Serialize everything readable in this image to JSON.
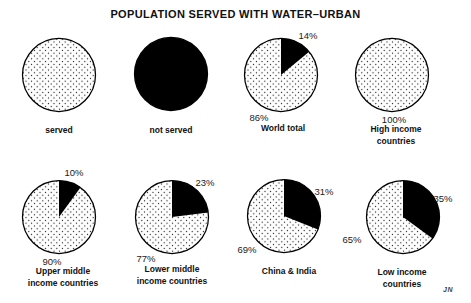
{
  "chart_data": {
    "type": "pie",
    "title": "POPULATION SERVED WITH WATER–URBAN",
    "legend_position": "top-left-as-first-two-circles",
    "grid": "off",
    "colors": {
      "served_pattern": "black dot stipple on white",
      "not_served": "#000000",
      "background": "#ffffff",
      "outline": "#000000"
    },
    "legend": [
      {
        "label": "served",
        "swatch": "stippled-circle"
      },
      {
        "label": "not served",
        "swatch": "solid-black-circle"
      }
    ],
    "pies": [
      {
        "label": "World total",
        "served": 86,
        "not_served": 14,
        "served_label": "86%",
        "not_served_label": "14%"
      },
      {
        "label": "High income countries",
        "served": 100,
        "not_served": 0,
        "served_label": "100%",
        "not_served_label": ""
      },
      {
        "label": "Upper middle\nincome countries",
        "served": 90,
        "not_served": 10,
        "served_label": "90%",
        "not_served_label": "10%"
      },
      {
        "label": "Lower middle\nincome countries",
        "served": 77,
        "not_served": 23,
        "served_label": "77%",
        "not_served_label": "23%"
      },
      {
        "label": "China & India",
        "served": 69,
        "not_served": 31,
        "served_label": "69%",
        "not_served_label": "31%"
      },
      {
        "label": "Low income countries",
        "served": 65,
        "not_served": 35,
        "served_label": "65%",
        "not_served_label": "35%"
      }
    ],
    "signature": "JN"
  }
}
